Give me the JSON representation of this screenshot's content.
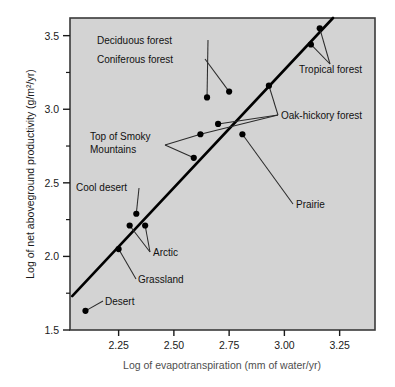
{
  "figure": {
    "plot_bg": "#d3d3d3",
    "frame_color": "#3a3a3a",
    "point_color": "#000000",
    "line_color": "#000000",
    "leader_color": "#2b2b2b"
  },
  "chart_data": {
    "type": "scatter",
    "title": "",
    "xlabel": "Log of evapotranspiration (mm of water/yr)",
    "ylabel": "Log of net aboveground productivity (g/m2/yr)",
    "ylabel_display": "Log of net aboveground productivity (g/m²/yr)",
    "xlim": [
      2.03,
      3.41
    ],
    "ylim": [
      1.5,
      3.62
    ],
    "xticks": [
      2.25,
      2.5,
      2.75,
      3.0,
      3.25
    ],
    "xtick_labels": [
      "2.25",
      "2.50",
      "2.75",
      "3.00",
      "3.25"
    ],
    "yticks": [
      1.5,
      2.0,
      2.5,
      3.0,
      3.5
    ],
    "ytick_labels": [
      "1.5",
      "2.0",
      "2.5",
      "3.0",
      "3.5"
    ],
    "y_minor_ticks": [
      1.75,
      2.25,
      2.75,
      3.25
    ],
    "grid": false,
    "legend": "none",
    "points": [
      {
        "name": "Desert",
        "x": 2.1,
        "y": 1.63
      },
      {
        "name": "Grassland",
        "x": 2.25,
        "y": 2.05
      },
      {
        "name": "Cool desert",
        "x": 2.33,
        "y": 2.29
      },
      {
        "name": "Arctic A",
        "x": 2.3,
        "y": 2.21
      },
      {
        "name": "Arctic B",
        "x": 2.37,
        "y": 2.21
      },
      {
        "name": "Top of Smoky Mountains",
        "x": 2.59,
        "y": 2.67
      },
      {
        "name": "Oak-hickory forest A",
        "x": 2.62,
        "y": 2.83
      },
      {
        "name": "Oak-hickory forest B",
        "x": 2.7,
        "y": 2.9
      },
      {
        "name": "Deciduous forest",
        "x": 2.65,
        "y": 3.08
      },
      {
        "name": "Coniferous forest",
        "x": 2.75,
        "y": 3.12
      },
      {
        "name": "Prairie",
        "x": 2.81,
        "y": 2.83
      },
      {
        "name": "Oak-hickory forest C",
        "x": 2.93,
        "y": 3.16
      },
      {
        "name": "Tropical forest A",
        "x": 3.12,
        "y": 3.44
      },
      {
        "name": "Tropical forest B",
        "x": 3.16,
        "y": 3.55
      }
    ],
    "fit_line": {
      "x0": 2.04,
      "y0": 1.73,
      "x1": 3.22,
      "y1": 3.62
    }
  },
  "annotations": [
    {
      "id": "deciduous-forest",
      "label": "Deciduous forest"
    },
    {
      "id": "coniferous-forest",
      "label": "Coniferous forest"
    },
    {
      "id": "tropical-forest",
      "label": "Tropical forest"
    },
    {
      "id": "oak-hickory-forest",
      "label": "Oak-hickory forest"
    },
    {
      "id": "top-of-smoky-mountains-line1",
      "label": "Top of Smoky"
    },
    {
      "id": "top-of-smoky-mountains-line2",
      "label": "Mountains"
    },
    {
      "id": "cool-desert",
      "label": "Cool desert"
    },
    {
      "id": "arctic",
      "label": "Arctic"
    },
    {
      "id": "grassland",
      "label": "Grassland"
    },
    {
      "id": "desert",
      "label": "Desert"
    },
    {
      "id": "prairie",
      "label": "Prairie"
    }
  ]
}
